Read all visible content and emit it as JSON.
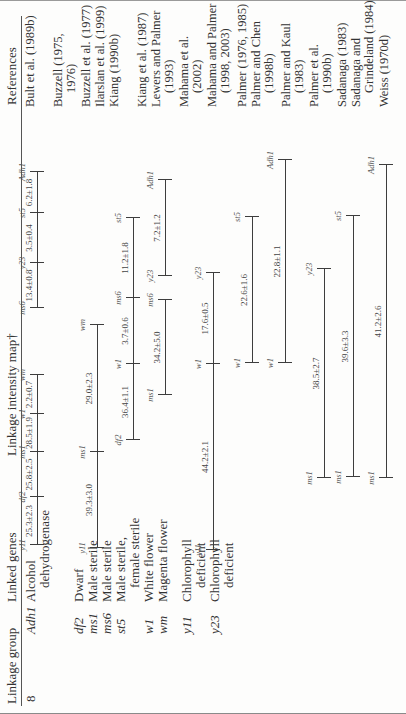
{
  "table": {
    "headers": {
      "linkage_group": "Linkage group",
      "linked_genes": "Linked genes",
      "map": "Linkage intensity map†",
      "references": "References"
    },
    "linkage_group": "8",
    "genes": [
      {
        "symbol": "Adh1",
        "name": "Alcohol",
        "name2": "dehydrogenase"
      },
      {
        "symbol": "df2",
        "name": "Dwarf"
      },
      {
        "symbol": "ms1",
        "name": "Male sterile"
      },
      {
        "symbol": "ms6",
        "name": "Male sterile"
      },
      {
        "symbol": "st5",
        "name": "Male sterile,",
        "name2": "female sterile"
      },
      {
        "symbol": "w1",
        "name": "White flower"
      },
      {
        "symbol": "wm",
        "name": "Magenta flower"
      },
      {
        "symbol": "y11",
        "name": "Chlorophyll",
        "name2": "deficient"
      },
      {
        "symbol": "y23",
        "name": "Chlorophyll",
        "name2": "deficient"
      }
    ],
    "references": [
      {
        "line1": "Bult et al. (1989b)"
      },
      {
        "line1": "Buzzell (1975,",
        "line2": "1976)"
      },
      {
        "line1": "Buzzell et al. (1977)"
      },
      {
        "line1": "Ilarslan et al. (1999)"
      },
      {
        "line1": "Kiang (1990b)"
      },
      {
        "line1": "Kiang et al. (1987)"
      },
      {
        "line1": "Lewers and Palmer",
        "line2": "(1993)"
      },
      {
        "line1": "Mahama et al.",
        "line2": "(2002)"
      },
      {
        "line1": "Mahama and Palmer",
        "line2": "(1998, 2003)"
      },
      {
        "line1": "Palmer (1976, 1985)"
      },
      {
        "line1": "Palmer and Chen",
        "line2": "(1998b)"
      },
      {
        "line1": "Palmer and Kaul",
        "line2": "(1983)"
      },
      {
        "line1": "Palmer et al.",
        "line2": "(1990b)"
      },
      {
        "line1": "Sadanaga (1983)"
      },
      {
        "line1": "Sadanaga and",
        "line2": "Grindeland (1984)"
      },
      {
        "line1": "Weiss (1970d)"
      }
    ],
    "maps": [
      {
        "segments": [
          {
            "genes": [
              "y11",
              "df2",
              "ms1",
              "w1",
              "wm"
            ],
            "pos": [
              169,
              217,
              262,
              300,
              339
            ],
            "distances": [
              "25.3±2.3",
              "25.8±2.5",
              "28.5±1.9",
              "2.2±0.7"
            ]
          },
          {
            "genes": [
              "ms6",
              "y23",
              "st5",
              "Adh1"
            ],
            "pos": [
              406,
              451,
              501,
              542
            ],
            "distances": [
              "13.4±0.8",
              "3.5±0.4",
              "6.2±1.8"
            ]
          }
        ]
      },
      {
        "segments": [
          {
            "genes": [
              "y11",
              "ms1",
              "wm"
            ],
            "pos": [
              166,
              262,
              389
            ],
            "distances": [
              "39.3±3.0",
              "29.0±2.3"
            ]
          }
        ]
      },
      {
        "segments": [
          {
            "genes": [
              "df2",
              "w1",
              "ms6",
              "st5"
            ],
            "pos": [
              274,
              350,
              416,
              496
            ],
            "distances": [
              "36.4±1.1",
              "3.7±0.6",
              "11.2±1.8"
            ]
          }
        ]
      },
      {
        "segments": [
          {
            "genes": [
              "ms1",
              "ms6"
            ],
            "pos": [
              319,
              414
            ],
            "distances": [
              "34.2±5.0"
            ]
          },
          {
            "genes": [
              "y23",
              "Adh1"
            ],
            "pos": [
              438,
              534
            ],
            "distances": [
              "7.2±1.2"
            ]
          }
        ]
      },
      {
        "segments": [
          {
            "genes": [
              "y11",
              "w1",
              "y23"
            ],
            "pos": [
              164,
              350,
              441
            ],
            "distances": [
              "44.2±2.1",
              "17.6±0.5"
            ]
          }
        ]
      },
      {
        "segments": [
          {
            "genes": [
              "w1",
              "st5"
            ],
            "pos": [
              351,
              497
            ],
            "distances": [
              "22.6±1.6"
            ]
          }
        ]
      },
      {
        "segments": [
          {
            "genes": [
              "w1",
              "Adh1"
            ],
            "pos": [
              351,
              554
            ],
            "distances": [
              "22.8±1.1"
            ]
          }
        ]
      },
      {
        "segments": [
          {
            "genes": [
              "ms1",
              "y23"
            ],
            "pos": [
              236,
              445
            ],
            "distances": [
              "38.5±2.7"
            ]
          }
        ]
      },
      {
        "segments": [
          {
            "genes": [
              "ms1",
              "st5"
            ],
            "pos": [
              237,
              498
            ],
            "distances": [
              "39.6±3.3"
            ]
          }
        ]
      },
      {
        "segments": [
          {
            "genes": [
              "ms1",
              "Adh1"
            ],
            "pos": [
              236,
              549
            ],
            "distances": [
              "41.2±2.6"
            ]
          }
        ]
      }
    ]
  }
}
